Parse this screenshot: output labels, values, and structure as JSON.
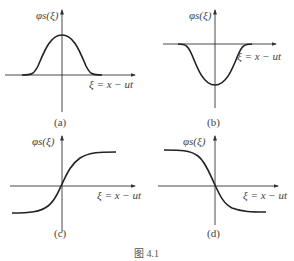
{
  "figure": {
    "caption": "图 4.1",
    "panels": [
      {
        "id": "a",
        "label": "(a)",
        "ylabel": "φs(ξ)",
        "xlabel": "ξ = x − ut",
        "shape": "bell-positive"
      },
      {
        "id": "b",
        "label": "(b)",
        "ylabel": "φs(ξ)",
        "xlabel": "ξ = x − ut",
        "shape": "bell-negative"
      },
      {
        "id": "c",
        "label": "(c)",
        "ylabel": "φs(ξ)",
        "xlabel": "ξ = x − ut",
        "shape": "kink-increasing"
      },
      {
        "id": "d",
        "label": "(d)",
        "ylabel": "φs(ξ)",
        "xlabel": "ξ = x − ut",
        "shape": "kink-decreasing"
      }
    ]
  }
}
